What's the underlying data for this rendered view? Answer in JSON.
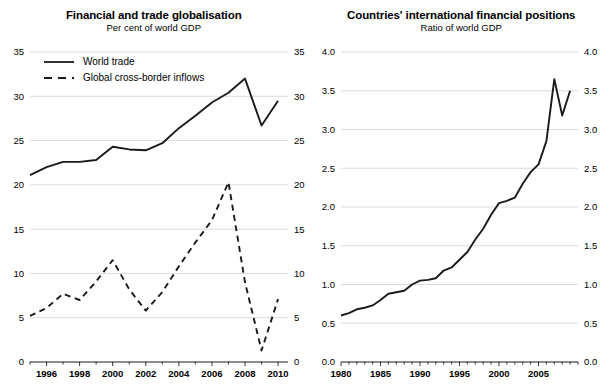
{
  "figure": {
    "width": 615,
    "height": 392,
    "background": "#ffffff",
    "line_color": "#1a1a1a",
    "grid_color": "#cccccc",
    "axis_color": "#000000"
  },
  "panels": [
    {
      "key": "left",
      "title": "Financial and trade globalisation",
      "subtitle": "Per cent of world GDP",
      "legend": [
        {
          "label": "World trade",
          "style": "solid"
        },
        {
          "label": "Global cross-border inflows",
          "style": "dashed"
        }
      ]
    },
    {
      "key": "right",
      "title": "Countries' international financial positions",
      "subtitle": "Ratio of world GDP",
      "legend": []
    }
  ],
  "chart_data": [
    {
      "type": "line",
      "title": "Financial and trade globalisation",
      "subtitle": "Per cent of world GDP",
      "xlabel": "",
      "ylabel": "Per cent of world GDP",
      "xlim": [
        1995,
        2010.6
      ],
      "ylim": [
        0,
        35
      ],
      "yticks": [
        0,
        5,
        10,
        15,
        20,
        25,
        30,
        35
      ],
      "ytick_labels": [
        "0",
        "5",
        "10",
        "15",
        "20",
        "25",
        "30",
        "35"
      ],
      "xticks": [
        1996,
        1998,
        2000,
        2002,
        2004,
        2006,
        2008,
        2010
      ],
      "xtick_labels": [
        "1996",
        "1998",
        "2000",
        "2002",
        "2004",
        "2006",
        "2008",
        "2010"
      ],
      "x_minor_tick_step": 1,
      "grid": "horizontal",
      "dual_y_axis": true,
      "legend_position": "top-left",
      "x": [
        1995,
        1996,
        1997,
        1998,
        1999,
        2000,
        2001,
        2002,
        2003,
        2004,
        2005,
        2006,
        2007,
        2008,
        2009,
        2010
      ],
      "series": [
        {
          "name": "World trade",
          "style": "solid",
          "values": [
            21.1,
            22.0,
            22.6,
            22.6,
            22.8,
            24.3,
            24.0,
            23.9,
            24.7,
            26.4,
            27.8,
            29.3,
            30.4,
            32.0,
            26.7,
            29.5
          ]
        },
        {
          "name": "Global cross-border inflows",
          "style": "dashed",
          "values": [
            5.2,
            6.1,
            7.7,
            7.0,
            9.1,
            11.5,
            8.2,
            5.8,
            7.9,
            10.8,
            13.5,
            16.0,
            20.3,
            9.0,
            1.3,
            7.1
          ]
        }
      ]
    },
    {
      "type": "line",
      "title": "Countries' international financial positions",
      "subtitle": "Ratio of world GDP",
      "xlabel": "",
      "ylabel": "Ratio of world GDP",
      "xlim": [
        1980,
        2010
      ],
      "ylim": [
        0.0,
        4.0
      ],
      "yticks": [
        0.0,
        0.5,
        1.0,
        1.5,
        2.0,
        2.5,
        3.0,
        3.5,
        4.0
      ],
      "ytick_labels": [
        "0.0",
        "0.5",
        "1.0",
        "1.5",
        "2.0",
        "2.5",
        "3.0",
        "3.5",
        "4.0"
      ],
      "xticks": [
        1980,
        1985,
        1990,
        1995,
        2000,
        2005
      ],
      "xtick_labels": [
        "1980",
        "1985",
        "1990",
        "1995",
        "2000",
        "2005"
      ],
      "x_minor_tick_step": 1,
      "grid": "horizontal",
      "dual_y_axis": true,
      "legend_position": "none",
      "x": [
        1980,
        1981,
        1982,
        1983,
        1984,
        1985,
        1986,
        1987,
        1988,
        1989,
        1990,
        1991,
        1992,
        1993,
        1994,
        1995,
        1996,
        1997,
        1998,
        1999,
        2000,
        2001,
        2002,
        2003,
        2004,
        2005,
        2006,
        2007,
        2008,
        2009
      ],
      "series": [
        {
          "name": "International financial positions",
          "style": "solid",
          "values": [
            0.6,
            0.63,
            0.68,
            0.7,
            0.73,
            0.8,
            0.88,
            0.9,
            0.92,
            1.0,
            1.05,
            1.06,
            1.08,
            1.18,
            1.22,
            1.32,
            1.42,
            1.58,
            1.72,
            1.9,
            2.05,
            2.08,
            2.12,
            2.3,
            2.45,
            2.55,
            2.85,
            3.65,
            3.18,
            3.5
          ]
        }
      ]
    }
  ]
}
